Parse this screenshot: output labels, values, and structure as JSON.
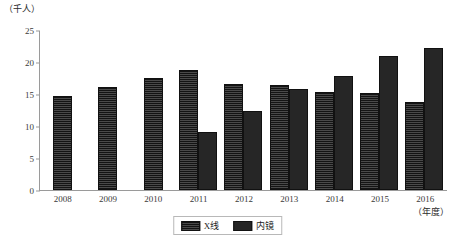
{
  "chart_data": {
    "type": "bar",
    "title": "",
    "unit_caption": "（千人）",
    "xlabel": "（年度）",
    "ylabel": "",
    "categories": [
      "2008",
      "2009",
      "2010",
      "2011",
      "2012",
      "2013",
      "2014",
      "2015",
      "2016"
    ],
    "series": [
      {
        "name": "X线",
        "fill": "striped",
        "color": "#1c1c1c",
        "values": [
          14.4,
          15.8,
          17.2,
          18.4,
          16.3,
          16.1,
          15.0,
          14.8,
          13.4
        ]
      },
      {
        "name": "内镜",
        "fill": "solid",
        "color": "#262626",
        "values": [
          null,
          null,
          null,
          8.7,
          12.0,
          15.4,
          17.5,
          20.7,
          21.9
        ]
      }
    ],
    "ylim": [
      0,
      25
    ],
    "yticks": [
      0,
      5,
      10,
      15,
      20,
      25
    ],
    "ytick_labels": [
      "0",
      "5",
      "10",
      "15",
      "20",
      "25"
    ],
    "grid": false,
    "legend_position": "bottom-center"
  },
  "legend": {
    "items": [
      {
        "label": "X线",
        "swatch": "striped-dark-swatch"
      },
      {
        "label": "内镜",
        "swatch": "solid-dark-swatch"
      }
    ]
  }
}
